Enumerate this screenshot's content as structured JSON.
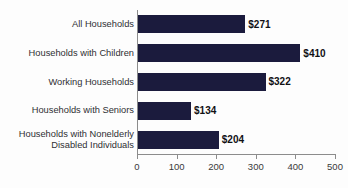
{
  "chart_data": {
    "type": "bar",
    "orientation": "horizontal",
    "title": "",
    "subtitle": "",
    "xlabel": "",
    "ylabel": "",
    "categories": [
      "All Households",
      "Households with Children",
      "Working Households",
      "Households with Seniors",
      "Households with Nonelderly\nDisabled Individuals"
    ],
    "values": [
      271,
      410,
      322,
      134,
      204
    ],
    "data_labels": [
      "$271",
      "$410",
      "$322",
      "$134",
      "$204"
    ],
    "xlim": [
      0,
      500
    ],
    "xticks": [
      0,
      100,
      200,
      300,
      400,
      500
    ],
    "xtick_labels": [
      "0",
      "100",
      "200",
      "300",
      "400",
      "500"
    ],
    "grid": false,
    "legend": false,
    "legend_position": "none",
    "bar_color": "#1b1b3d",
    "axis_color": "#8c8c8c",
    "label_color": "#2f2f33",
    "value_label_color": "#111114",
    "background_color": "#fdfdfd"
  }
}
